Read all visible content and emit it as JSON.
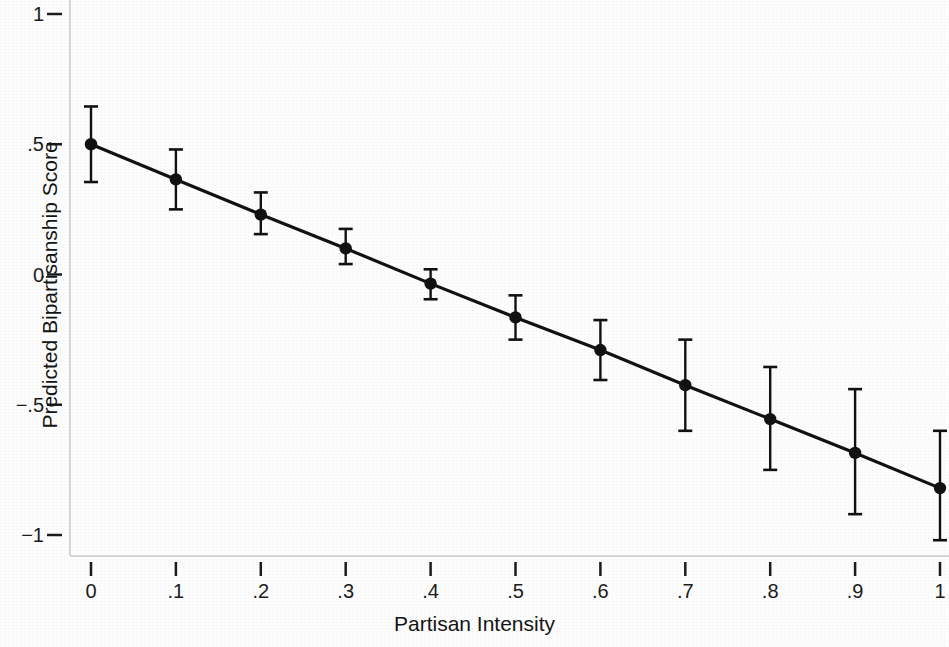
{
  "chart_data": {
    "type": "line",
    "title": "",
    "subtitle": "",
    "xlabel": "Partisan Intensity",
    "ylabel": "Predicted Bipartisanship Score",
    "xlim": [
      0,
      1
    ],
    "ylim": [
      -1,
      1
    ],
    "grid": false,
    "legend": "none",
    "error_bars": "vertical capped confidence intervals",
    "marker": "filled circle",
    "line_color": "#111111",
    "marker_color": "#111111",
    "background_color": "#fdfdfd",
    "x": [
      0,
      0.1,
      0.2,
      0.3,
      0.4,
      0.5,
      0.6,
      0.7,
      0.8,
      0.9,
      1
    ],
    "values": [
      0.5,
      0.365,
      0.23,
      0.1,
      -0.035,
      -0.165,
      -0.29,
      -0.425,
      -0.555,
      -0.685,
      -0.82
    ],
    "ci_low": [
      0.355,
      0.25,
      0.155,
      0.04,
      -0.095,
      -0.25,
      -0.405,
      -0.6,
      -0.75,
      -0.92,
      -1.02
    ],
    "ci_high": [
      0.645,
      0.48,
      0.315,
      0.175,
      0.02,
      -0.08,
      -0.175,
      -0.25,
      -0.355,
      -0.44,
      -0.6
    ],
    "xticks": [
      {
        "value": 0,
        "label": "0"
      },
      {
        "value": 0.1,
        "label": ".1"
      },
      {
        "value": 0.2,
        "label": ".2"
      },
      {
        "value": 0.3,
        "label": ".3"
      },
      {
        "value": 0.4,
        "label": ".4"
      },
      {
        "value": 0.5,
        "label": ".5"
      },
      {
        "value": 0.6,
        "label": ".6"
      },
      {
        "value": 0.7,
        "label": ".7"
      },
      {
        "value": 0.8,
        "label": ".8"
      },
      {
        "value": 0.9,
        "label": ".9"
      },
      {
        "value": 1,
        "label": "1"
      }
    ],
    "yticks": [
      {
        "value": 1,
        "label": "1"
      },
      {
        "value": 0.5,
        "label": ".5"
      },
      {
        "value": 0,
        "label": "0"
      },
      {
        "value": -0.5,
        "label": "−.5"
      },
      {
        "value": -1,
        "label": "−1"
      }
    ]
  }
}
